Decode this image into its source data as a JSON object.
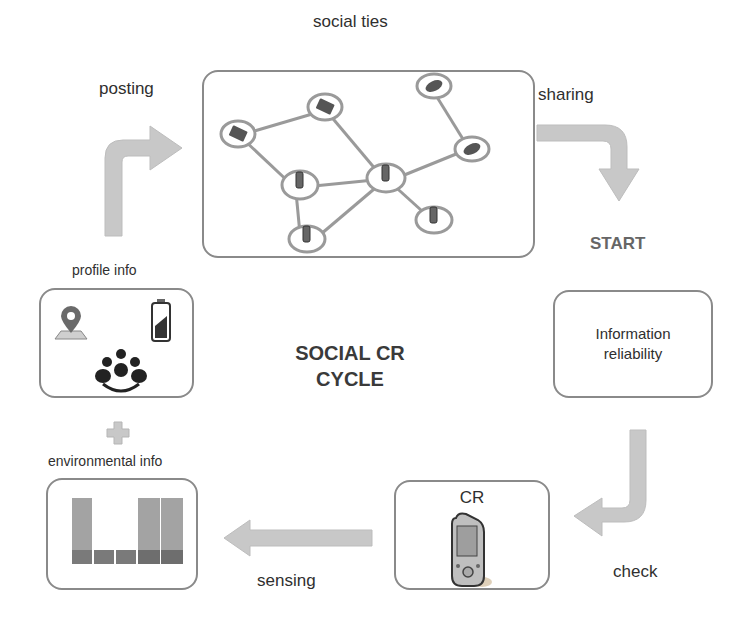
{
  "diagram": {
    "title_line1": "SOCIAL CR",
    "title_line2": "CYCLE",
    "start_label": "START",
    "social_ties": {
      "label": "social ties",
      "nodes": [
        {
          "id": "laptop-left",
          "type": "laptop",
          "x": 55,
          "y": 62
        },
        {
          "id": "laptop-top",
          "type": "laptop",
          "x": 121,
          "y": 35
        },
        {
          "id": "car-top",
          "type": "car",
          "x": 218,
          "y": 17
        },
        {
          "id": "car-right",
          "type": "car",
          "x": 268,
          "y": 77
        },
        {
          "id": "phone-left",
          "type": "phone",
          "x": 96,
          "y": 113
        },
        {
          "id": "phone-center",
          "type": "phone",
          "x": 182,
          "y": 106
        },
        {
          "id": "phone-bottom-left",
          "type": "phone",
          "x": 103,
          "y": 167
        },
        {
          "id": "phone-bottom-right",
          "type": "phone",
          "x": 230,
          "y": 148
        }
      ],
      "edges": [
        [
          "laptop-left",
          "laptop-top"
        ],
        [
          "laptop-left",
          "phone-left"
        ],
        [
          "laptop-top",
          "phone-center"
        ],
        [
          "car-top",
          "car-right"
        ],
        [
          "car-right",
          "phone-center"
        ],
        [
          "phone-left",
          "phone-center"
        ],
        [
          "phone-left",
          "phone-bottom-left"
        ],
        [
          "phone-center",
          "phone-bottom-left"
        ],
        [
          "phone-center",
          "phone-bottom-right"
        ]
      ]
    },
    "arrows": {
      "posting": "posting",
      "sharing": "sharing",
      "check": "check",
      "sensing": "sensing"
    },
    "information_reliability": {
      "line1": "Information",
      "line2": "reliability"
    },
    "cr_box": {
      "label": "CR"
    },
    "profile_info": {
      "label": "profile info",
      "icons": [
        "map-pin-icon",
        "battery-icon",
        "group-icon"
      ]
    },
    "plus_symbol": "+",
    "environmental_info": {
      "label": "environmental info",
      "bars": [
        {
          "top": 100,
          "bottom": 22
        },
        {
          "top": 0,
          "bottom": 22
        },
        {
          "top": 0,
          "bottom": 22
        },
        {
          "top": 100,
          "bottom": 22
        },
        {
          "top": 100,
          "bottom": 22
        }
      ]
    },
    "colors": {
      "arrow_fill": "#c8c8c8",
      "box_border": "#8a8a8a",
      "bar_light": "#a3a3a3",
      "bar_dark": "#7a7a7a",
      "edge": "#9a9a9a"
    }
  }
}
